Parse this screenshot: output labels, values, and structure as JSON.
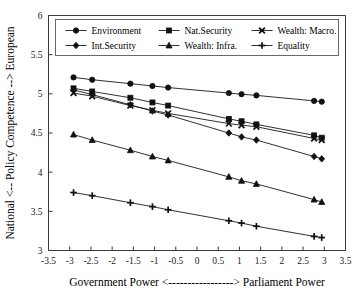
{
  "chart_data": {
    "type": "line",
    "title": "",
    "subtitle": "",
    "xlabel": "Government Power <-----------------> Parliament Power",
    "ylabel": "National <-- Policy Competence --> European",
    "xlim": [
      -3.5,
      3.5
    ],
    "ylim": [
      3,
      6
    ],
    "xticks": [
      "-3.5",
      "-3",
      "-2.5",
      "-2",
      "-1.5",
      "-1",
      "-0.5",
      "0",
      "0.5",
      "1",
      "1.5",
      "2",
      "2.5",
      "3",
      "3.5"
    ],
    "xtickvalues": [
      -3.5,
      -3,
      -2.5,
      -2,
      -1.5,
      -1,
      -0.5,
      0,
      0.5,
      1,
      1.5,
      2,
      2.5,
      3,
      3.5
    ],
    "yticks": [
      "3",
      "3.5",
      "4",
      "4.5",
      "5",
      "5.5",
      "6"
    ],
    "ytickvalues": [
      3,
      3.5,
      4,
      4.5,
      5,
      5.5,
      6
    ],
    "grid": false,
    "legend_position": "top-inside",
    "x": [
      -2.91,
      -2.47,
      -1.57,
      -1.05,
      -0.68,
      0.75,
      1.05,
      1.4,
      2.76,
      2.94
    ],
    "series": [
      {
        "name": "Environment",
        "marker": "circle",
        "values": [
          5.21,
          5.18,
          5.13,
          5.1,
          5.08,
          5.01,
          4.995,
          4.98,
          4.91,
          4.9
        ]
      },
      {
        "name": "Nat.Security",
        "marker": "square",
        "values": [
          5.07,
          5.03,
          4.95,
          4.89,
          4.85,
          4.68,
          4.65,
          4.61,
          4.47,
          4.44
        ]
      },
      {
        "name": "Wealth: Macro.",
        "marker": "x",
        "values": [
          5.01,
          4.97,
          4.85,
          4.79,
          4.75,
          4.62,
          4.6,
          4.58,
          4.43,
          4.41
        ]
      },
      {
        "name": "Int.Security",
        "marker": "diamond",
        "values": [
          5.05,
          4.99,
          4.86,
          4.78,
          4.73,
          4.5,
          4.45,
          4.41,
          4.2,
          4.17
        ]
      },
      {
        "name": "Wealth: Infra.",
        "marker": "triangle",
        "values": [
          4.48,
          4.41,
          4.28,
          4.2,
          4.15,
          3.94,
          3.89,
          3.85,
          3.65,
          3.62
        ]
      },
      {
        "name": "Equality",
        "marker": "plus",
        "values": [
          3.74,
          3.7,
          3.61,
          3.56,
          3.52,
          3.38,
          3.35,
          3.31,
          3.18,
          3.165
        ]
      }
    ]
  },
  "legend": {
    "entries": [
      {
        "label": "Environment",
        "marker": "circle"
      },
      {
        "label": "Nat.Security",
        "marker": "square"
      },
      {
        "label": "Wealth: Macro.",
        "marker": "x"
      },
      {
        "label": "Int.Security",
        "marker": "diamond"
      },
      {
        "label": "Wealth: Infra.",
        "marker": "triangle"
      },
      {
        "label": "Equality",
        "marker": "plus"
      }
    ]
  },
  "colors": {
    "marker": "#111111",
    "line": "#1a1a1a",
    "axis": "#3a3a3a",
    "background": "#ffffff"
  }
}
